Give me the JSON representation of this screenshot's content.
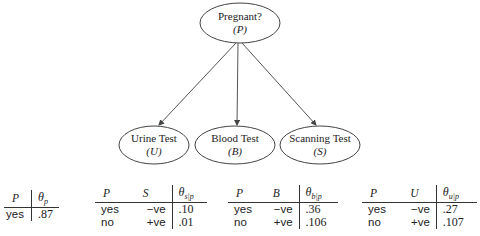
{
  "diagram": {
    "type": "bayesian-network",
    "nodes": [
      {
        "id": "P",
        "name": "Pregnant?",
        "symbol": "(P)"
      },
      {
        "id": "U",
        "name": "Urine Test",
        "symbol": "(U)"
      },
      {
        "id": "B",
        "name": "Blood Test",
        "symbol": "(B)"
      },
      {
        "id": "S",
        "name": "Scanning Test",
        "symbol": "(S)"
      }
    ],
    "edges": [
      {
        "from": "P",
        "to": "U"
      },
      {
        "from": "P",
        "to": "B"
      },
      {
        "from": "P",
        "to": "S"
      }
    ]
  },
  "tables": {
    "prior": {
      "headers": [
        "P",
        "θ",
        "p"
      ],
      "rows": [
        [
          "yes",
          ".87"
        ]
      ]
    },
    "scan": {
      "headers": [
        "P",
        "S",
        "θ",
        "s|p"
      ],
      "rows": [
        [
          "yes",
          "−ve",
          ".10"
        ],
        [
          "no",
          "+ve",
          ".01"
        ]
      ]
    },
    "blood": {
      "headers": [
        "P",
        "B",
        "θ",
        "b|p"
      ],
      "rows": [
        [
          "yes",
          "−ve",
          ".36"
        ],
        [
          "no",
          "+ve",
          ".106"
        ]
      ]
    },
    "urine": {
      "headers": [
        "P",
        "U",
        "θ",
        "u|p"
      ],
      "rows": [
        [
          "yes",
          "−ve",
          ".27"
        ],
        [
          "no",
          "+ve",
          ".107"
        ]
      ]
    }
  }
}
